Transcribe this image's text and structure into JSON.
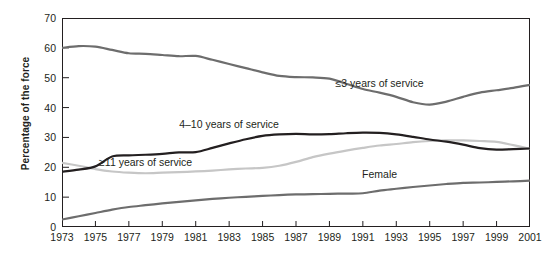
{
  "chart_data": {
    "type": "line",
    "title": "",
    "xlabel": "",
    "ylabel": "Percentage of the force",
    "xlim": [
      1973,
      2001
    ],
    "ylim": [
      0,
      70
    ],
    "grid": false,
    "legend_position": "inline-annotations",
    "yticks": [
      0,
      10,
      20,
      30,
      40,
      50,
      60,
      70
    ],
    "x": [
      1973,
      1974,
      1975,
      1976,
      1977,
      1978,
      1979,
      1980,
      1981,
      1982,
      1983,
      1984,
      1985,
      1986,
      1987,
      1988,
      1989,
      1990,
      1991,
      1992,
      1993,
      1994,
      1995,
      1996,
      1997,
      1998,
      1999,
      2000,
      2001
    ],
    "xticks": [
      "1973",
      "1975",
      "1977",
      "1979",
      "1981",
      "1983",
      "1985",
      "1987",
      "1989",
      "1991",
      "1993",
      "1995",
      "1997",
      "1999",
      "2001"
    ],
    "series": [
      {
        "name": "≤3 years of service",
        "color": "#6d6d6d",
        "label_x": 1992,
        "label_y": 48,
        "values": [
          60.0,
          60.6,
          60.4,
          59.3,
          58.2,
          58.0,
          57.6,
          57.2,
          57.3,
          56.0,
          54.6,
          53.2,
          51.8,
          50.6,
          50.2,
          50.1,
          49.7,
          48.0,
          46.2,
          45.0,
          43.6,
          41.8,
          41.0,
          42.0,
          43.6,
          45.0,
          45.8,
          46.6,
          47.6
        ]
      },
      {
        "name": "4–10 years of service",
        "color": "#231f20",
        "label_x": 1983,
        "label_y": 34.2,
        "values": [
          18.5,
          19.2,
          20.3,
          23.6,
          24.0,
          24.2,
          24.5,
          25.0,
          25.1,
          26.5,
          28.0,
          29.4,
          30.5,
          31.0,
          31.2,
          31.0,
          31.1,
          31.4,
          31.6,
          31.5,
          31.0,
          30.2,
          29.3,
          28.6,
          27.6,
          26.4,
          25.9,
          26.1,
          26.3
        ]
      },
      {
        "name": "≥11 years of service",
        "color": "#c6c6c6",
        "label_x": 1978,
        "label_y": 21.3,
        "values": [
          21.5,
          20.5,
          19.4,
          18.6,
          18.2,
          18.0,
          18.2,
          18.4,
          18.6,
          18.9,
          19.3,
          19.6,
          19.8,
          20.5,
          21.8,
          23.4,
          24.6,
          25.6,
          26.5,
          27.3,
          27.8,
          28.4,
          28.8,
          29.0,
          29.0,
          28.8,
          28.5,
          27.4,
          26.2
        ]
      },
      {
        "name": "Female",
        "color": "#6d6d6d",
        "label_x": 1992,
        "label_y": 17.5,
        "values": [
          2.5,
          3.6,
          4.7,
          5.8,
          6.7,
          7.3,
          7.9,
          8.4,
          8.9,
          9.4,
          9.8,
          10.1,
          10.4,
          10.7,
          10.9,
          11.0,
          11.1,
          11.2,
          11.3,
          12.2,
          12.8,
          13.4,
          13.9,
          14.4,
          14.8,
          14.9,
          15.1,
          15.3,
          15.5
        ]
      }
    ]
  }
}
